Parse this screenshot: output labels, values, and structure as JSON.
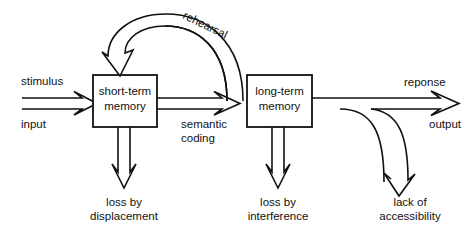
{
  "diagram": {
    "background_color": "#ffffff",
    "line_color": "#111111",
    "boxes": [
      {
        "id": "stm",
        "line1": "short-term",
        "line2": "memory"
      },
      {
        "id": "ltm",
        "line1": "long-term",
        "line2": "memory"
      }
    ],
    "labels": {
      "stimulus": "stimulus",
      "input": "input",
      "rehearsal": "rehearsal",
      "semantic_line1": "semantic",
      "semantic_line2": "coding",
      "response": "reponse",
      "output": "output",
      "loss_displacement_line1": "loss by",
      "loss_displacement_line2": "displacement",
      "loss_interference_line1": "loss by",
      "loss_interference_line2": "interference",
      "lack_access_line1": "lack of",
      "lack_access_line2": "accessibility"
    }
  }
}
